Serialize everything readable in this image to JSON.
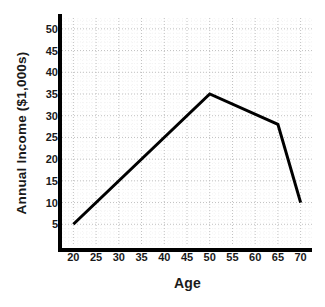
{
  "chart_data": {
    "type": "line",
    "title": "",
    "xlabel": "Age",
    "ylabel": "Annual Income ($1,000s)",
    "xlim": [
      17.5,
      72.5
    ],
    "ylim": [
      0,
      52.5
    ],
    "xticks": [
      20,
      25,
      30,
      35,
      40,
      45,
      50,
      55,
      60,
      65,
      70
    ],
    "xticklabels": [
      "20",
      "25",
      "30",
      "35",
      "40",
      "45",
      "50",
      "55",
      "60",
      "65",
      "70"
    ],
    "yticks": [
      5,
      10,
      15,
      20,
      25,
      30,
      35,
      40,
      45,
      50
    ],
    "yticklabels": [
      "5",
      "10",
      "15",
      "20",
      "25",
      "30",
      "35",
      "40",
      "45",
      "50"
    ],
    "grid": true,
    "grid_style": "dotted",
    "grid_color": "#b9b9b9",
    "minor_grid": true,
    "legend": false,
    "line_color": "#000000",
    "line_width": 3,
    "series": [
      {
        "name": "Annual Income",
        "x": [
          20,
          50,
          65,
          70
        ],
        "values": [
          5,
          35,
          28,
          10
        ]
      }
    ]
  },
  "axes": {
    "x_title": "Age",
    "y_title": "Annual Income ($1,000s)"
  }
}
